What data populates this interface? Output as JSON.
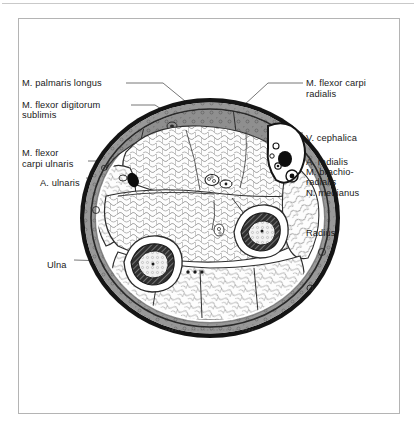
{
  "figure": {
    "type": "anatomical-cross-section",
    "region": "forearm",
    "view": "transverse section (axial) of the distal forearm"
  },
  "frame": {
    "border_color": "#b4b4b4",
    "rule_color": "#c9c9c9"
  },
  "colors": {
    "skin_ring": "#141414",
    "subcutaneous": "#8f8f8f",
    "fascia": "#6e6e6e",
    "muscle_fill": "#fdfdfd",
    "muscle_outline": "#3a3a3a",
    "bone_cortex": "#2b2b2b",
    "vessel_dark": "#0d0d0d",
    "leader": "#4a4a4a"
  },
  "labels": {
    "left": [
      {
        "id": "m-palmaris-longus",
        "text": "M. palmaris longus",
        "x": 22,
        "y": 78,
        "leader_to_x": 163,
        "leader_to_y": 112
      },
      {
        "id": "m-flexor-digitorum",
        "text": "M. flexor digitorum",
        "x": 22,
        "y": 100,
        "leader_to_x": 152,
        "leader_to_y": 122
      },
      {
        "id": "sublimis",
        "text": "sublimis",
        "x": 22,
        "y": 110,
        "leader_to_x": null,
        "leader_to_y": null
      },
      {
        "id": "m-flexor-carpi-ulnaris-1",
        "text": "M. flexor",
        "x": 22,
        "y": 148,
        "leader_to_x": null,
        "leader_to_y": null
      },
      {
        "id": "m-flexor-carpi-ulnaris-2",
        "text": "carpi ulnaris",
        "x": 22,
        "y": 159,
        "leader_to_x": 121,
        "leader_to_y": 162
      },
      {
        "id": "a-ulnaris",
        "text": "A. ulnaris",
        "x": 40,
        "y": 178,
        "leader_to_x": 127,
        "leader_to_y": 181
      },
      {
        "id": "ulna",
        "text": "Ulna",
        "x": 47,
        "y": 260,
        "leader_to_x": 140,
        "leader_to_y": 263
      }
    ],
    "right": [
      {
        "id": "m-flexor-carpi-radialis-1",
        "text": "M. flexor carpi",
        "x": 306,
        "y": 78,
        "leader_to_x": 243,
        "leader_to_y": 106
      },
      {
        "id": "m-flexor-carpi-radialis-2",
        "text": "radialis",
        "x": 306,
        "y": 89,
        "leader_to_x": null,
        "leader_to_y": null
      },
      {
        "id": "v-cephalica",
        "text": "V. cephalica",
        "x": 306,
        "y": 133,
        "leader_to_x": 276,
        "leader_to_y": 128
      },
      {
        "id": "a-radialis",
        "text": "A. radialis",
        "x": 306,
        "y": 157,
        "leader_to_x": 281,
        "leader_to_y": 166
      },
      {
        "id": "m-brachioradialis-1",
        "text": "M. brachio-",
        "x": 306,
        "y": 167,
        "leader_to_x": 288,
        "leader_to_y": 173
      },
      {
        "id": "m-brachioradialis-2",
        "text": "radialis",
        "x": 306,
        "y": 177,
        "leader_to_x": null,
        "leader_to_y": null
      },
      {
        "id": "n-medianus",
        "text": "N. medianus",
        "x": 306,
        "y": 188,
        "leader_to_x": 223,
        "leader_to_y": 184
      },
      {
        "id": "radius",
        "text": "Radius",
        "x": 306,
        "y": 228,
        "leader_to_x": 258,
        "leader_to_y": 231
      }
    ]
  },
  "structures": [
    {
      "name": "ulna",
      "type": "bone",
      "cx": 153,
      "cy": 264,
      "rx": 28,
      "ry": 26
    },
    {
      "name": "radius",
      "type": "bone",
      "cx": 262,
      "cy": 231,
      "rx": 26,
      "ry": 25
    },
    {
      "name": "v-cephalica",
      "type": "vein",
      "cx": 283,
      "cy": 138
    },
    {
      "name": "a-radialis",
      "type": "artery",
      "cx": 277,
      "cy": 163
    },
    {
      "name": "a-ulnaris",
      "type": "artery",
      "cx": 133,
      "cy": 180
    },
    {
      "name": "n-medianus",
      "type": "nerve",
      "cx": 213,
      "cy": 180
    }
  ]
}
